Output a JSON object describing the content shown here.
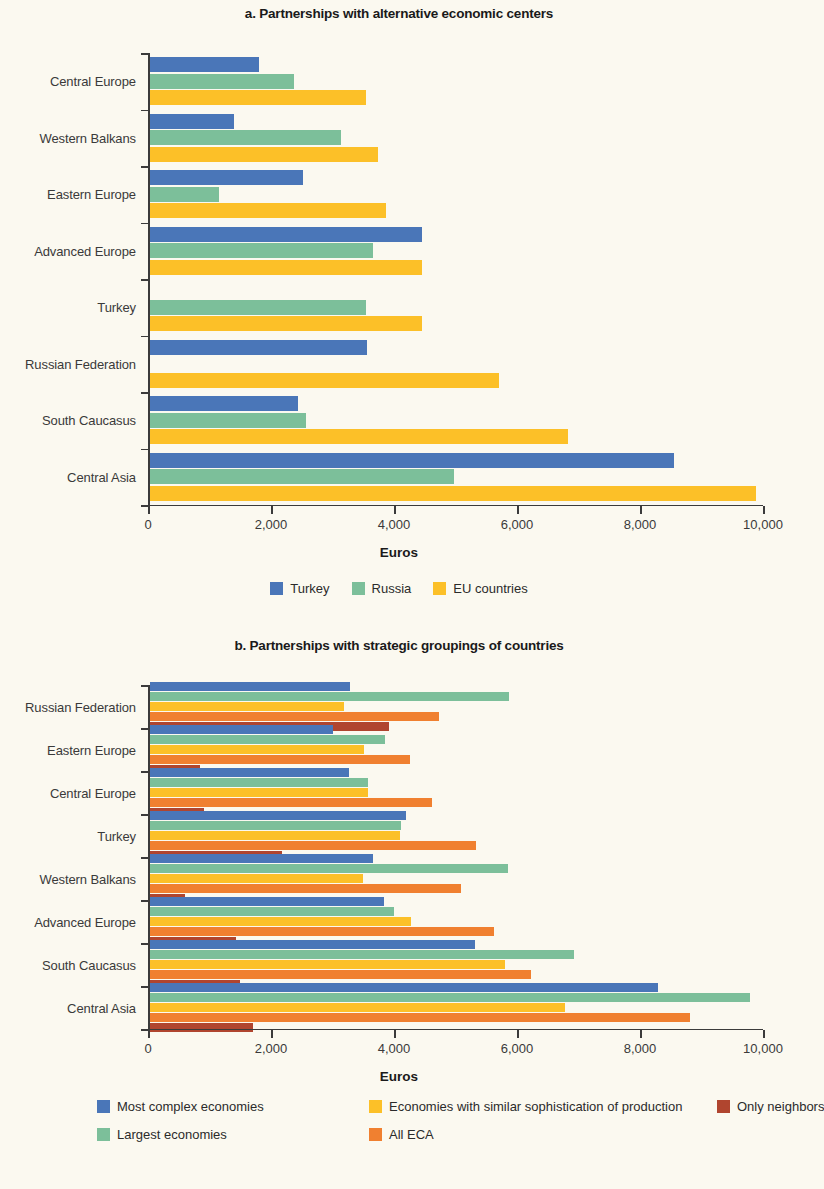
{
  "chart_data": [
    {
      "type": "bar",
      "orientation": "horizontal",
      "title": "a. Partnerships with alternative economic centers",
      "xlabel": "Euros",
      "ylabel": "",
      "xlim": [
        0,
        10000
      ],
      "xticks": [
        0,
        2000,
        4000,
        6000,
        8000,
        10000
      ],
      "xticklabels": [
        "0",
        "2,000",
        "4,000",
        "6,000",
        "8,000",
        "10,000"
      ],
      "grid": false,
      "legend_position": "bottom",
      "categories": [
        "Central Europe",
        "Western Balkans",
        "Eastern Europe",
        "Advanced Europe",
        "Turkey",
        "Russian Federation",
        "South Caucasus",
        "Central Asia"
      ],
      "series": [
        {
          "name": "Turkey",
          "color": "#4a76b8",
          "values": [
            1780,
            1360,
            2480,
            4420,
            null,
            3530,
            2400,
            8520
          ]
        },
        {
          "name": "Russia",
          "color": "#7cbf9a",
          "values": [
            2340,
            3110,
            1120,
            3620,
            3520,
            null,
            2530,
            4950
          ]
        },
        {
          "name": "EU countries",
          "color": "#fcc028",
          "values": [
            3520,
            3700,
            3830,
            4430,
            4420,
            5670,
            6790,
            9850
          ]
        }
      ]
    },
    {
      "type": "bar",
      "orientation": "horizontal",
      "title": "b. Partnerships with strategic groupings of countries",
      "xlabel": "Euros",
      "ylabel": "",
      "xlim": [
        0,
        10000
      ],
      "xticks": [
        0,
        2000,
        4000,
        6000,
        8000,
        10000
      ],
      "xticklabels": [
        "0",
        "2,000",
        "4,000",
        "6,000",
        "8,000",
        "10,000"
      ],
      "grid": false,
      "legend_position": "bottom",
      "categories": [
        "Russian Federation",
        "Eastern Europe",
        "Central Europe",
        "Turkey",
        "Western Balkans",
        "Advanced Europe",
        "South Caucasus",
        "Central Asia"
      ],
      "series": [
        {
          "name": "Most complex economies",
          "color": "#4a76b8",
          "values": [
            3250,
            2980,
            3230,
            4160,
            3620,
            3800,
            5290,
            8260
          ]
        },
        {
          "name": "Largest economies",
          "color": "#7cbf9a",
          "values": [
            5840,
            3820,
            3540,
            4080,
            5820,
            3970,
            6900,
            9750
          ]
        },
        {
          "name": "Economies with similar sophistication of production",
          "color": "#fcc028",
          "values": [
            3150,
            3480,
            3540,
            4060,
            3470,
            4240,
            5780,
            6750
          ]
        },
        {
          "name": "All ECA",
          "color": "#f08030",
          "values": [
            4700,
            4230,
            4580,
            5300,
            5050,
            5600,
            6200,
            8780
          ]
        },
        {
          "name": "Only neighbors",
          "color": "#b0452f",
          "values": [
            3880,
            820,
            880,
            2150,
            570,
            1400,
            1460,
            1680
          ]
        }
      ]
    }
  ],
  "charts": {
    "a": {
      "title": "a. Partnerships with alternative economic centers",
      "xtitle": "Euros",
      "legend": [
        {
          "label": "Turkey",
          "color": "#4a76b8"
        },
        {
          "label": "Russia",
          "color": "#7cbf9a"
        },
        {
          "label": "EU countries",
          "color": "#fcc028"
        }
      ]
    },
    "b": {
      "title": "b. Partnerships with strategic groupings of countries",
      "xtitle": "Euros",
      "legend_rows": [
        [
          {
            "label": "Most complex economies",
            "color": "#4a76b8"
          },
          {
            "label": "Economies with similar sophistication of production",
            "color": "#fcc028"
          },
          {
            "label": "Only neighbors",
            "color": "#b0452f"
          }
        ],
        [
          {
            "label": "Largest economies",
            "color": "#7cbf9a"
          },
          {
            "label": "All ECA",
            "color": "#f08030"
          }
        ]
      ]
    }
  }
}
